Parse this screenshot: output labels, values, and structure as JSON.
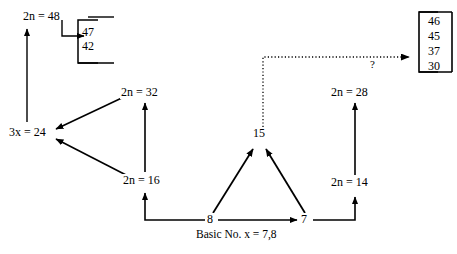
{
  "diagram": {
    "title_caption": "Basic No. x = 7,8",
    "unknown_marker": "?",
    "colors": {
      "ink": "#000000",
      "background": "#ffffff"
    },
    "nodes": {
      "top_left_result": {
        "prefix": "2",
        "var": "n",
        "eq": " = ",
        "value": "48",
        "full": "2n = 48"
      },
      "left_sum": {
        "prefix": "3",
        "var": "x",
        "eq": " = ",
        "value": "24",
        "full": "3x = 24"
      },
      "left_upper": {
        "prefix": "2",
        "var": "n",
        "eq": " = ",
        "value": "32",
        "full": "2n = 32"
      },
      "left_lower": {
        "prefix": "2",
        "var": "n",
        "eq": " = ",
        "value": "16",
        "full": "2n = 16"
      },
      "center_mid": {
        "full": "15"
      },
      "basic_eight": {
        "full": "8"
      },
      "basic_seven": {
        "full": "7"
      },
      "right_lower": {
        "prefix": "2",
        "var": "n",
        "eq": " = ",
        "value": "14",
        "full": "2n = 14"
      },
      "right_upper": {
        "prefix": "2",
        "var": "n",
        "eq": " = ",
        "value": "28",
        "full": "2n = 28"
      }
    },
    "bracket_left": {
      "values": [
        "47",
        "42"
      ]
    },
    "bracket_right": {
      "values": [
        "46",
        "45",
        "37",
        "30"
      ]
    }
  }
}
